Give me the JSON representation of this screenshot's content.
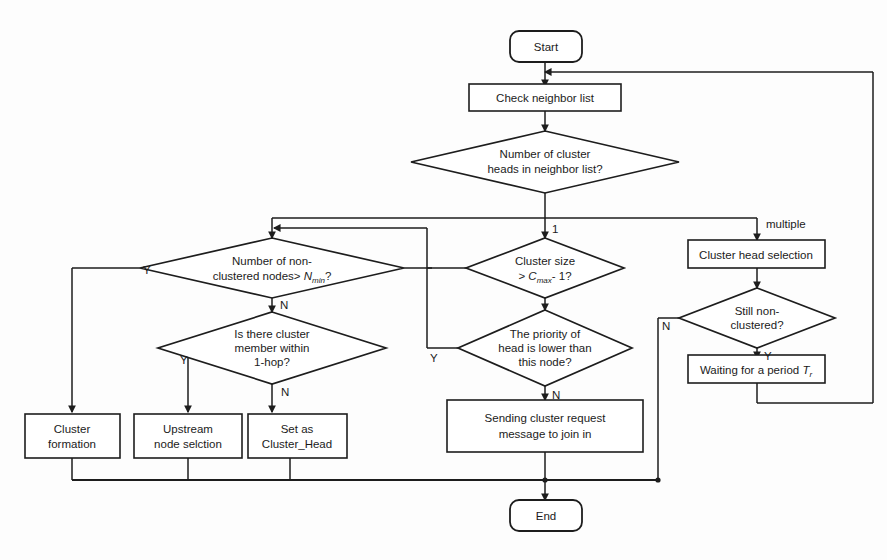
{
  "diagram": {
    "colors": {
      "background": "#fdfdfd",
      "stroke": "#1d1d1d",
      "node_fill": "#ffffff",
      "text": "#1b1b1b"
    },
    "nodes": {
      "start": {
        "label": "Start",
        "type": "terminator"
      },
      "check_neighbor": {
        "label": "Check neighbor list",
        "type": "process"
      },
      "num_heads": {
        "line1": "Number of cluster",
        "line2": "heads in neighbor list?",
        "type": "decision"
      },
      "num_nonclustered": {
        "line1": "Number of non-",
        "line2_pre": "clustered nodes> ",
        "line2_var": "N",
        "line2_sub": "min",
        "line2_post": "?",
        "type": "decision"
      },
      "cluster_size": {
        "line1": "Cluster size",
        "line2_pre": "> ",
        "line2_var": "C",
        "line2_sub": "max",
        "line2_post": "- 1?",
        "type": "decision"
      },
      "head_selection": {
        "label": "Cluster head selection",
        "type": "process"
      },
      "member_1hop": {
        "line1": "Is there cluster",
        "line2": "member within",
        "line3": "1-hop?",
        "type": "decision"
      },
      "priority_lower": {
        "line1": "The priority of",
        "line2": "head is lower than",
        "line3": "this node?",
        "type": "decision"
      },
      "still_nonclustered": {
        "line1": "Still non-",
        "line2": "clustered?",
        "type": "decision"
      },
      "waiting": {
        "pre": "Waiting for a period ",
        "var": "T",
        "sub": "r",
        "type": "process"
      },
      "cluster_formation": {
        "line1": "Cluster",
        "line2": "formation",
        "type": "process"
      },
      "upstream_selection": {
        "line1": "Upstream",
        "line2": "node selction",
        "type": "process"
      },
      "set_cluster_head": {
        "line1": "Set as",
        "line2": "Cluster_Head",
        "type": "process"
      },
      "send_request": {
        "line1": "Sending cluster request",
        "line2": "message to join in",
        "type": "process"
      },
      "end": {
        "label": "End",
        "type": "terminator"
      }
    },
    "edge_labels": {
      "heads_one": "1",
      "heads_multiple": "multiple",
      "nonclustered_yes": "Y",
      "nonclustered_no": "N",
      "member_yes": "Y",
      "member_no": "N",
      "clustersize_yes": "Y",
      "priority_no": "N",
      "still_no": "N",
      "still_yes": "Y"
    }
  }
}
